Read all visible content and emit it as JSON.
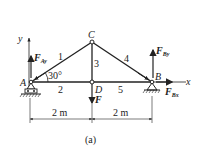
{
  "diagram": {
    "caption": "(a)",
    "nodes": {
      "A": "A",
      "B": "B",
      "C": "C",
      "D": "D"
    },
    "members": [
      "1",
      "2",
      "3",
      "4",
      "5"
    ],
    "angle_label": "30°",
    "axes": {
      "x": "x",
      "y": "y"
    },
    "forces": {
      "F_Ay": {
        "main": "F",
        "sub": "Ay"
      },
      "F_By": {
        "main": "F",
        "sub": "By"
      },
      "F_Bx": {
        "main": "F",
        "sub": "Bx"
      },
      "F": {
        "main": "F"
      }
    },
    "dimensions": [
      "2 m",
      "2 m"
    ]
  }
}
